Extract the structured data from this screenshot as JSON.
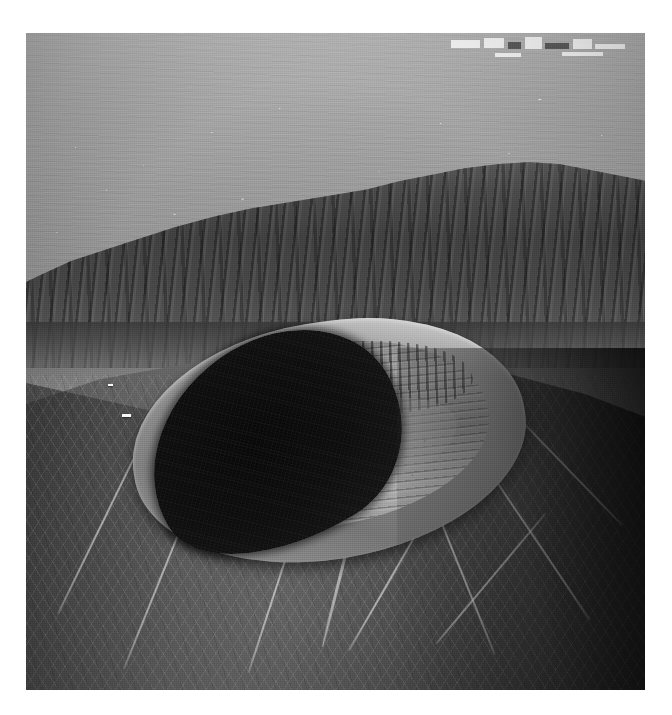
{
  "document": {
    "type": "photographic-plate",
    "background_color": "#ffffff",
    "caption": ""
  },
  "photo": {
    "title": "Aerial photograph of a volcanic summit crater",
    "medium": "black-and-white aerial photograph",
    "orientation": "landscape-oblique",
    "frame": {
      "left": 26,
      "top": 33,
      "width": 619,
      "height": 657
    },
    "palette": {
      "paper": "#ffffff",
      "distant_plain": "#a8a8a8",
      "haze_highlight": "#b6b6b6",
      "somma_ridge": "#454545",
      "cone_left_flank": "#3c3c3c",
      "cone_right_flank": "#121212",
      "crater_rim_highlight": "#c8c8c8",
      "crater_inner_wall": "#9b9b9b",
      "crater_shadow": "#141414",
      "urban_white": "#f6f6f6"
    },
    "regions": [
      {
        "name": "distant-coastal-plain",
        "description": "Hazy grey urbanised plain filling the upper third of the frame, speckled with small bright building clusters receding to the horizon.",
        "tone": "light-grey"
      },
      {
        "name": "urban-blocks-upper-right",
        "description": "Cluster of bright rectangular built structures at the very top right corner of the frame.",
        "tone": "white"
      },
      {
        "name": "somma-ridge",
        "description": "Dark fluted escarpment crossing the middle of the frame, the remnant caldera wall behind the active cone.",
        "tone": "dark-grey"
      },
      {
        "name": "atrio-valley",
        "description": "Shadowed saddle between the outer ridge and the base of the cone.",
        "tone": "mid-dark-grey"
      },
      {
        "name": "crater-rim",
        "description": "Elliptical summit crater rim, brightly lit along its far upper-right crest.",
        "tone": "light-grey"
      },
      {
        "name": "crater-inner-wall",
        "description": "Stratified inner crater wall showing horizontal lava and tephra layering with vertical erosion gullies.",
        "tone": "mid-grey"
      },
      {
        "name": "crater-floor",
        "description": "Pale rubble-strewn crater floor terrace with talus blocks.",
        "tone": "light-grey"
      },
      {
        "name": "crater-shadow",
        "description": "Deep black shadow filling the near left lobe of the crater interior.",
        "tone": "black"
      },
      {
        "name": "outer-cone-flank",
        "description": "Ash-covered outer slopes of the cone radiating toward the bottom of the frame, scored by pale erosion rills and trails.",
        "tone": "dark-grey"
      },
      {
        "name": "summit-building",
        "description": "Small white building or station perched on the left-hand crater rim.",
        "tone": "white"
      }
    ],
    "urban_blocks": [
      {
        "left": 2,
        "top": 8,
        "width": 16,
        "height": 13,
        "tone": "white"
      },
      {
        "left": 20,
        "top": 4,
        "width": 11,
        "height": 17,
        "tone": "white"
      },
      {
        "left": 33,
        "top": 10,
        "width": 7,
        "height": 12,
        "tone": "dark"
      },
      {
        "left": 42,
        "top": 2,
        "width": 9,
        "height": 20,
        "tone": "white"
      },
      {
        "left": 53,
        "top": 12,
        "width": 13,
        "height": 10,
        "tone": "dark"
      },
      {
        "left": 68,
        "top": 6,
        "width": 10,
        "height": 16,
        "tone": "white"
      },
      {
        "left": 80,
        "top": 14,
        "width": 16,
        "height": 9,
        "tone": "white"
      },
      {
        "left": 62,
        "top": 28,
        "width": 22,
        "height": 7,
        "tone": "white"
      },
      {
        "left": 26,
        "top": 30,
        "width": 14,
        "height": 6,
        "tone": "white"
      }
    ],
    "trails": [
      {
        "left": 52,
        "top": 60,
        "width": 3,
        "height": 34,
        "rotate": 14
      },
      {
        "left": 60,
        "top": 66,
        "width": 2,
        "height": 30,
        "rotate": 30
      },
      {
        "left": 68,
        "top": 58,
        "width": 2,
        "height": 38,
        "rotate": -22
      },
      {
        "left": 75,
        "top": 70,
        "width": 2,
        "height": 26,
        "rotate": 40
      },
      {
        "left": 82,
        "top": 62,
        "width": 2,
        "height": 30,
        "rotate": -34
      },
      {
        "left": 40,
        "top": 72,
        "width": 2,
        "height": 26,
        "rotate": 18
      },
      {
        "left": 22,
        "top": 66,
        "width": 2,
        "height": 32,
        "rotate": 22
      },
      {
        "left": 12,
        "top": 60,
        "width": 2,
        "height": 30,
        "rotate": 26
      },
      {
        "left": 88,
        "top": 56,
        "width": 2,
        "height": 22,
        "rotate": -44
      }
    ],
    "buildings": [
      {
        "left": 15.5,
        "top": 58.0,
        "width": 9,
        "height": 3
      },
      {
        "left": 13.2,
        "top": 53.4,
        "width": 5,
        "height": 2
      }
    ]
  }
}
